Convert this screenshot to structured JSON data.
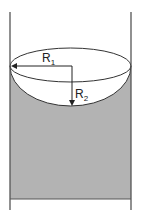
{
  "diagram": {
    "labels": {
      "r1_main": "R",
      "r1_sub": "1",
      "r2_main": "R",
      "r2_sub": "2"
    },
    "colors": {
      "liquid": "#b3b3b3",
      "meniscus_surface": "#ffffff",
      "stroke": "#333333",
      "wall": "#555555"
    }
  }
}
